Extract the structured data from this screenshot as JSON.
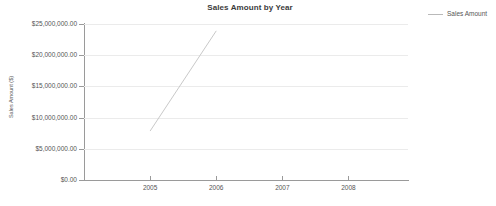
{
  "chart_data": {
    "type": "line",
    "title": "Sales Amount by Year",
    "xlabel": "",
    "ylabel": "Sales Amount ($)",
    "x": [
      2005,
      2006,
      2007,
      2008
    ],
    "xtick_labels": [
      "2005",
      "2006",
      "2007",
      "2008"
    ],
    "xlim": [
      2004.0,
      2008.9
    ],
    "ylim": [
      0,
      25000000
    ],
    "ytick_values": [
      0,
      5000000,
      10000000,
      15000000,
      20000000,
      25000000
    ],
    "ytick_labels": [
      "$0.00",
      "$5,000,000.00",
      "$10,000,000.00",
      "$15,000,000.00",
      "$20,000,000.00",
      "$25,000,000.00"
    ],
    "grid": true,
    "legend_position": "right",
    "series": [
      {
        "name": "Sales Amount",
        "color": "#c9c9c9",
        "x": [
          2005,
          2006
        ],
        "values": [
          7850000,
          23900000
        ]
      }
    ]
  },
  "legend": {
    "entries": [
      {
        "label": "Sales Amount",
        "color": "#b9b9b9"
      }
    ]
  }
}
